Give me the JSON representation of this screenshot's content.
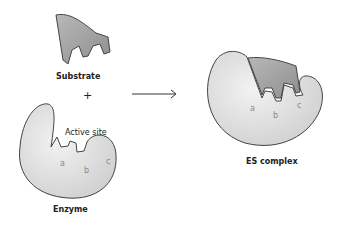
{
  "diagram": {
    "labels": {
      "substrate": "Substrate",
      "plus": "+",
      "active_site": "Active site",
      "enzyme": "Enzyme",
      "es_complex": "ES complex"
    },
    "binding_sites": {
      "enzyme": [
        "a",
        "b",
        "c"
      ],
      "complex": [
        "a",
        "b",
        "c"
      ]
    },
    "colors": {
      "enzyme_fill": "#d9d9d9",
      "substrate_fill": "#9a9a9a",
      "outline": "#444444",
      "site_letter": "#8a8a8a"
    }
  }
}
